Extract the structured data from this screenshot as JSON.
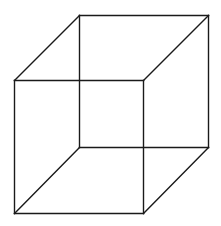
{
  "diagram": {
    "type": "wireframe-cube",
    "stroke_color": "#1a1a1a",
    "background": "#ffffff",
    "back_face": {
      "top_left": [
        79,
        15
      ],
      "top_right": [
        208,
        15
      ],
      "bottom_right": [
        208,
        147
      ],
      "bottom_left": [
        79,
        147
      ]
    },
    "front_face": {
      "top_left": [
        14,
        80
      ],
      "top_right": [
        143,
        80
      ],
      "bottom_right": [
        143,
        213
      ],
      "bottom_left": [
        14,
        213
      ]
    },
    "edges": [
      {
        "name": "back-top-edge",
        "x1": 79,
        "y1": 15,
        "x2": 208,
        "y2": 15
      },
      {
        "name": "back-right-edge",
        "x1": 208,
        "y1": 15,
        "x2": 208,
        "y2": 147
      },
      {
        "name": "back-bottom-edge",
        "x1": 79,
        "y1": 147,
        "x2": 208,
        "y2": 147
      },
      {
        "name": "back-left-edge",
        "x1": 79,
        "y1": 15,
        "x2": 79,
        "y2": 147
      },
      {
        "name": "front-top-edge",
        "x1": 14,
        "y1": 80,
        "x2": 143,
        "y2": 80
      },
      {
        "name": "front-right-edge",
        "x1": 143,
        "y1": 80,
        "x2": 143,
        "y2": 213
      },
      {
        "name": "front-bottom-edge",
        "x1": 14,
        "y1": 213,
        "x2": 143,
        "y2": 213
      },
      {
        "name": "front-left-edge",
        "x1": 14,
        "y1": 80,
        "x2": 14,
        "y2": 213
      },
      {
        "name": "connector-top-left",
        "x1": 14,
        "y1": 80,
        "x2": 79,
        "y2": 15
      },
      {
        "name": "connector-top-right",
        "x1": 143,
        "y1": 80,
        "x2": 208,
        "y2": 15
      },
      {
        "name": "connector-bottom-left",
        "x1": 14,
        "y1": 213,
        "x2": 79,
        "y2": 147
      },
      {
        "name": "connector-bottom-right",
        "x1": 143,
        "y1": 213,
        "x2": 208,
        "y2": 147
      }
    ]
  }
}
